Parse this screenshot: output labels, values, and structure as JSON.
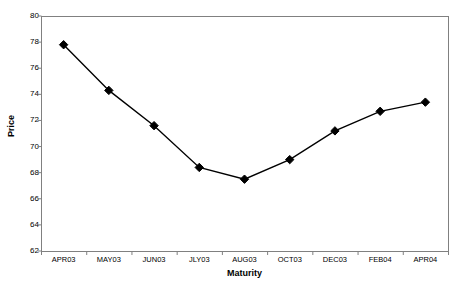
{
  "chart_data": {
    "type": "line",
    "title": "",
    "xlabel": "Maturity",
    "ylabel": "Price",
    "categories": [
      "APR03",
      "MAY03",
      "JUN03",
      "JLY03",
      "AUG03",
      "OCT03",
      "DEC03",
      "FEB04",
      "APR04"
    ],
    "values": [
      77.8,
      74.3,
      71.6,
      68.4,
      67.5,
      69.0,
      71.2,
      72.7,
      73.4
    ],
    "series": [
      {
        "name": "Price",
        "values": [
          77.8,
          74.3,
          71.6,
          68.4,
          67.5,
          69.0,
          71.2,
          72.7,
          73.4
        ]
      }
    ],
    "ylim": [
      62,
      80
    ],
    "yticks": [
      62,
      64,
      66,
      68,
      70,
      72,
      74,
      76,
      78,
      80
    ],
    "ytick_labels": [
      "62",
      "64",
      "66",
      "68",
      "70",
      "72",
      "74",
      "76",
      "78",
      "80"
    ],
    "grid": false,
    "legend": null,
    "marker": "diamond",
    "line_color": "#000000",
    "marker_color": "#000000",
    "frame_color": "#808080",
    "background": "#FFFFFF"
  }
}
